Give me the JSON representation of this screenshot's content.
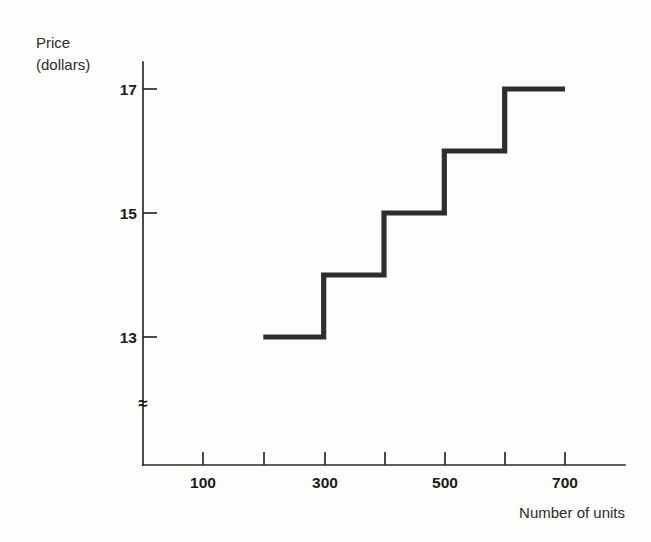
{
  "chart_data": {
    "type": "line",
    "subtype": "step",
    "title": "",
    "xlabel": "Number of units",
    "ylabel": "Price (dollars)",
    "ylabel_lines": [
      "Price",
      "(dollars)"
    ],
    "x": [
      200,
      300,
      300,
      400,
      400,
      500,
      500,
      600,
      600,
      700
    ],
    "y": [
      13,
      13,
      14,
      14,
      15,
      15,
      16,
      16,
      17,
      17
    ],
    "steps": [
      {
        "x_start": 200,
        "x_end": 300,
        "price": 13
      },
      {
        "x_start": 300,
        "x_end": 400,
        "price": 14
      },
      {
        "x_start": 400,
        "x_end": 500,
        "price": 15
      },
      {
        "x_start": 500,
        "x_end": 600,
        "price": 16
      },
      {
        "x_start": 600,
        "x_end": 700,
        "price": 17
      }
    ],
    "xticks": [
      100,
      200,
      300,
      400,
      500,
      600,
      700
    ],
    "xtick_labels": [
      "100",
      "",
      "300",
      "",
      "500",
      "",
      "700"
    ],
    "yticks": [
      13,
      15,
      17
    ],
    "ytick_labels": [
      "13",
      "15",
      "17"
    ],
    "xlim": [
      0,
      760
    ],
    "ylim": [
      12.2,
      17.6
    ],
    "grid": false,
    "legend": null,
    "axis_break": {
      "axis": "y",
      "symbol": "≈"
    },
    "series_color": "#2e2e2e"
  },
  "labels": {
    "y_axis_line1": "Price",
    "y_axis_line2": "(dollars)",
    "x_axis": "Number of units",
    "y_tick_17": "17",
    "y_tick_15": "15",
    "y_tick_13": "13",
    "x_tick_100": "100",
    "x_tick_300": "300",
    "x_tick_500": "500",
    "x_tick_700": "700",
    "break_symbol": "≈"
  },
  "colors": {
    "ink": "#2b2b2b",
    "series": "#2e2e2e",
    "background": "#fdfdfc"
  }
}
